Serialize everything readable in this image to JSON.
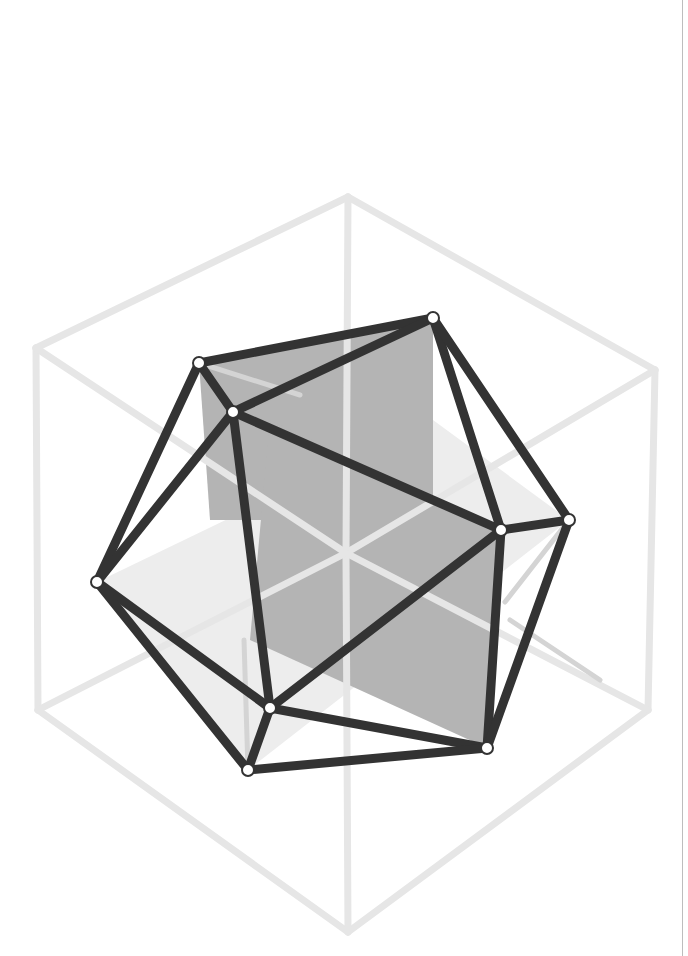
{
  "diagram": {
    "colors": {
      "background": "#ffffff",
      "cube_edge": "#e6e6e6",
      "icosahedron_edge": "#333333",
      "vertex_fill": "#ffffff",
      "vertical_rectangle": "#b4b4b4",
      "horizontal_rectangle": "#ededed",
      "back_edge": "#d4d4d4",
      "page_rule": "#bdbdbd"
    },
    "cube": {
      "corners": {
        "top": [
          348,
          197
        ],
        "upper_right": [
          655,
          370
        ],
        "lower_right": [
          648,
          710
        ],
        "bottom": [
          348,
          932
        ],
        "lower_left": [
          38,
          710
        ],
        "upper_left": [
          36,
          348
        ],
        "center": [
          346,
          553
        ]
      },
      "edges": [
        [
          "top",
          "upper_right"
        ],
        [
          "upper_right",
          "lower_right"
        ],
        [
          "lower_right",
          "bottom"
        ],
        [
          "bottom",
          "lower_left"
        ],
        [
          "lower_left",
          "upper_left"
        ],
        [
          "upper_left",
          "top"
        ],
        [
          "top",
          "center"
        ],
        [
          "upper_left",
          "center"
        ],
        [
          "upper_right",
          "center"
        ],
        [
          "center",
          "bottom"
        ],
        [
          "lower_left",
          "center"
        ],
        [
          "lower_right",
          "center"
        ]
      ]
    },
    "planes": [
      {
        "name": "horizontal-golden-rectangle",
        "fill": "#ededed",
        "points": [
          [
            97,
            582
          ],
          [
            433,
            420
          ],
          [
            569,
            520
          ],
          [
            248,
            770
          ]
        ]
      },
      {
        "name": "vertical-golden-rectangle-left",
        "fill": "#b4b4b4",
        "points": [
          [
            199,
            363
          ],
          [
            433,
            318
          ],
          [
            433,
            520
          ],
          [
            210,
            520
          ]
        ]
      },
      {
        "name": "vertical-golden-rectangle-right",
        "fill": "#b4b4b4",
        "points": [
          [
            270,
            420
          ],
          [
            501,
            530
          ],
          [
            487,
            748
          ],
          [
            250,
            640
          ]
        ]
      }
    ],
    "vertices": {
      "A": [
        199,
        363
      ],
      "B": [
        233,
        412
      ],
      "C": [
        433,
        318
      ],
      "D": [
        501,
        530
      ],
      "E": [
        569,
        520
      ],
      "F": [
        97,
        582
      ],
      "G": [
        270,
        708
      ],
      "H": [
        248,
        770
      ],
      "I": [
        487,
        748
      ]
    },
    "edges": [
      [
        "A",
        "C"
      ],
      [
        "A",
        "B"
      ],
      [
        "B",
        "C"
      ],
      [
        "A",
        "F"
      ],
      [
        "B",
        "F"
      ],
      [
        "B",
        "D"
      ],
      [
        "C",
        "D"
      ],
      [
        "C",
        "E"
      ],
      [
        "D",
        "E"
      ],
      [
        "D",
        "G"
      ],
      [
        "D",
        "I"
      ],
      [
        "E",
        "I"
      ],
      [
        "F",
        "G"
      ],
      [
        "F",
        "H"
      ],
      [
        "B",
        "G"
      ],
      [
        "G",
        "H"
      ],
      [
        "G",
        "I"
      ],
      [
        "H",
        "I"
      ]
    ],
    "back_edges": [
      [
        [
          199,
          363
        ],
        [
          300,
          395
        ]
      ],
      [
        [
          569,
          520
        ],
        [
          505,
          602
        ]
      ],
      [
        [
          510,
          620
        ],
        [
          600,
          680
        ]
      ],
      [
        [
          244,
          640
        ],
        [
          248,
          770
        ]
      ]
    ]
  }
}
